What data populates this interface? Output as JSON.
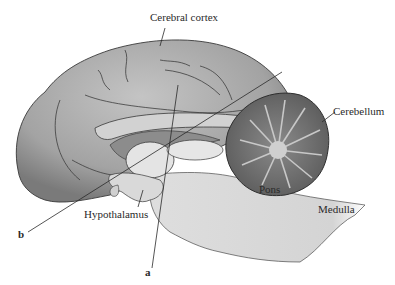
{
  "figure": {
    "type": "anatomical-diagram",
    "labels": {
      "cerebral_cortex": "Cerebral cortex",
      "cerebellum": "Cerebellum",
      "pons": "Pons",
      "medulla": "Medulla",
      "hypothalamus": "Hypothalamus",
      "a": "a",
      "b": "b"
    },
    "colors": {
      "cortex": "#a9a9a9",
      "cortex_dark": "#7d7d7d",
      "brainstem": "#dcdcdc",
      "cerebellum": "#6f6f6f",
      "outline": "#3a3a3a",
      "background": "#ffffff"
    }
  }
}
